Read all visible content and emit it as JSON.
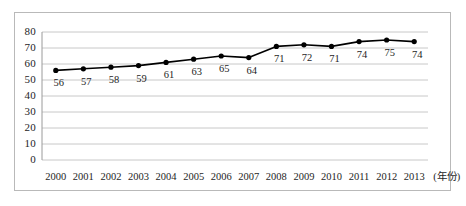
{
  "chart_data": {
    "type": "line",
    "title": "",
    "subtitle": "",
    "xlabel": "(年份)",
    "ylabel": "",
    "categories": [
      "2000",
      "2001",
      "2002",
      "2003",
      "2004",
      "2005",
      "2006",
      "2007",
      "2008",
      "2009",
      "2010",
      "2011",
      "2012",
      "2013"
    ],
    "values": [
      56,
      57,
      58,
      59,
      61,
      63,
      65,
      64,
      71,
      72,
      71,
      74,
      75,
      74
    ],
    "point_labels": [
      "56",
      "57",
      "58",
      "59",
      "61",
      "63",
      "65",
      "64",
      "71",
      "72",
      "71",
      "74",
      "75",
      "74"
    ],
    "ylim": [
      0,
      80
    ],
    "yticks": [
      0,
      10,
      20,
      30,
      40,
      50,
      60,
      70,
      80
    ],
    "ytick_labels": [
      "0",
      "10",
      "20",
      "30",
      "40",
      "50",
      "60",
      "70",
      "80"
    ],
    "grid": "horizontal",
    "legend": "none",
    "series": [
      {
        "name": "",
        "values": [
          56,
          57,
          58,
          59,
          61,
          63,
          65,
          64,
          71,
          72,
          71,
          74,
          75,
          74
        ],
        "line_color": "#000000",
        "marker": "filled-circle",
        "marker_color": "#000000"
      }
    ],
    "colors": {
      "line": "#000000",
      "marker": "#000000",
      "gridline": "#c8c8c8",
      "axis": "#9a9a9a",
      "frame": "#b9b9b9",
      "background": "#ffffff",
      "text": "#1e1e1e"
    }
  }
}
